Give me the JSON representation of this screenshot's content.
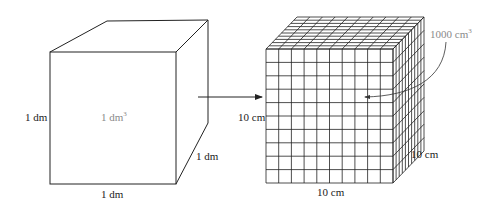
{
  "diagram": {
    "left_cube": {
      "volume_label": "1 dm",
      "volume_exp": "3",
      "height_label": "1 dm",
      "width_label": "1 dm",
      "depth_label": "1 dm"
    },
    "arrow": "right-arrow",
    "right_cube": {
      "grid_divisions": 10,
      "volume_label": "1000 cm",
      "volume_exp": "3",
      "height_label": "10 cm",
      "width_label": "10 cm",
      "depth_label": "10 cm"
    },
    "colors": {
      "line": "#222222",
      "label_gray": "#8a8a8a"
    }
  }
}
